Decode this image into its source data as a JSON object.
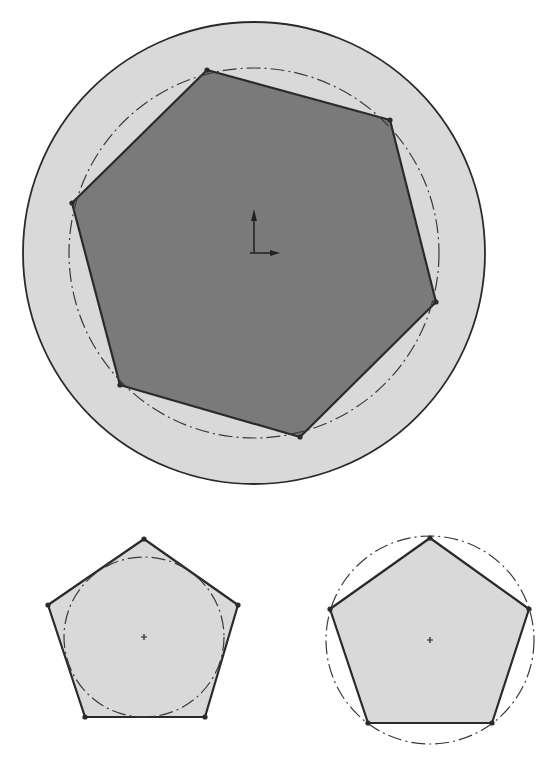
{
  "figure": {
    "colors": {
      "background": "#ffffff",
      "outline": "#2a2a2a",
      "light_fill": "#d9d9d9",
      "dark_fill": "#7a7a7a",
      "construction": "#3a3a3a"
    }
  },
  "shapes": {
    "top": {
      "outer_circle": {
        "cx": 254,
        "cy": 253,
        "r": 231
      },
      "construction_circle": {
        "cx": 254,
        "cy": 253,
        "r": 185,
        "style": "dash-dot"
      },
      "hexagon_points": "207,70 390,120 436,302 300,437 120,385 72,203",
      "origin_marker": {
        "x": 254,
        "y": 253
      }
    },
    "bottom_left": {
      "pentagon_points": "144,539 238,605 205,717 85,717 48,605",
      "inscribed_circle": {
        "cx": 144,
        "cy": 637,
        "r": 80,
        "style": "dash-dot"
      },
      "center_mark": {
        "x": 144,
        "y": 637
      }
    },
    "bottom_right": {
      "pentagon_points": "430,538 529,609 492,723 368,723 330,609",
      "circumscribed_circle": {
        "cx": 430,
        "cy": 640,
        "r": 104,
        "style": "dash-dot"
      },
      "center_mark": {
        "x": 430,
        "y": 640
      }
    }
  }
}
